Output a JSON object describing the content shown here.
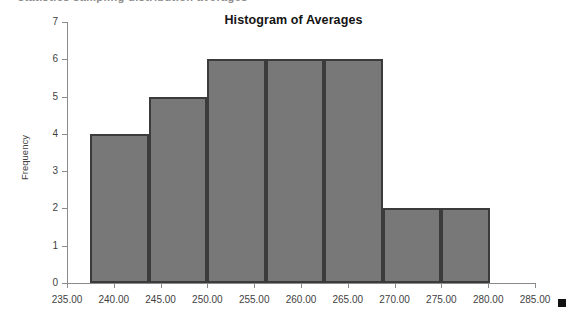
{
  "page": {
    "clipped_header_remnant": "statistics sampling distribution averages"
  },
  "legend": {
    "marker_name": "series-swatch",
    "marker_color": "#111111"
  },
  "style": {
    "bar_fill": "#787878",
    "bar_border": "#3b3b3b",
    "axis_color": "#8a8a8a",
    "text_color": "#3f3f3f",
    "title_color": "#141414",
    "background": "#ffffff"
  },
  "chart_data": {
    "type": "bar",
    "title": "Histogram of Averages",
    "xlabel": "",
    "ylabel": "Frequency",
    "ylim": [
      0,
      7
    ],
    "xlim": [
      235,
      285
    ],
    "grid": false,
    "legend_position": "bottom-right",
    "y_ticks": [
      7,
      6,
      5,
      4,
      3,
      2,
      1,
      0
    ],
    "y_tick_labels": [
      "7",
      "6",
      "5",
      "4",
      "3",
      "2",
      "1",
      "0"
    ],
    "x_ticks": [
      235,
      240,
      245,
      250,
      255,
      260,
      265,
      270,
      275,
      280,
      285
    ],
    "x_tick_labels": [
      "235.00",
      "240.00",
      "245.00",
      "250.00",
      "255.00",
      "260.00",
      "265.00",
      "270.00",
      "275.00",
      "280.00",
      "285.00"
    ],
    "bin_edges": [
      237.5,
      243.8,
      250.0,
      256.3,
      262.5,
      268.8,
      275.0,
      280.2
    ],
    "categories": [
      "237.5-243.8",
      "243.8-250.0",
      "250.0-256.3",
      "256.3-262.5",
      "262.5-268.8",
      "268.8-275.0",
      "275.0-280.2"
    ],
    "values": [
      4,
      5,
      6,
      6,
      6,
      2,
      2
    ],
    "series": [
      {
        "name": "Frequency",
        "values": [
          4,
          5,
          6,
          6,
          6,
          2,
          2
        ]
      }
    ]
  }
}
